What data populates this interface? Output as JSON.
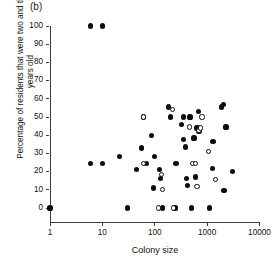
{
  "panel": {
    "label": "(b)"
  },
  "axes": {
    "y_title": "Percentage of residents that were two and three years old",
    "x_title": "Colony size",
    "y_ticks": [
      0,
      10,
      20,
      30,
      40,
      50,
      60,
      70,
      80,
      90,
      100
    ],
    "x_ticks": [
      1,
      10,
      100,
      1000,
      10000
    ]
  },
  "legend": {
    "filled_label": "filled circle",
    "open_label": "open circle"
  },
  "chart_data": {
    "type": "scatter",
    "title": "(b)",
    "xlabel": "Colony size",
    "ylabel": "Percentage of residents that were two and three years old",
    "xscale": "log",
    "yscale": "linear",
    "xlim": [
      1,
      10000
    ],
    "ylim": [
      0,
      100
    ],
    "xticks": [
      1,
      10,
      100,
      1000,
      10000
    ],
    "yticks": [
      0,
      10,
      20,
      30,
      40,
      50,
      60,
      70,
      80,
      90,
      100
    ],
    "grid": false,
    "legend_position": "none",
    "series": [
      {
        "name": "filled circle",
        "marker": "filled-circle",
        "color": "#0d0d0d",
        "points": [
          [
            1,
            0
          ],
          [
            6,
            100
          ],
          [
            10,
            100
          ],
          [
            6,
            24.5
          ],
          [
            10,
            24.5
          ],
          [
            21,
            28.5
          ],
          [
            30,
            0
          ],
          [
            45,
            21
          ],
          [
            55,
            33
          ],
          [
            62,
            50
          ],
          [
            70,
            24.5
          ],
          [
            88,
            40
          ],
          [
            95,
            11
          ],
          [
            100,
            28.5
          ],
          [
            125,
            21
          ],
          [
            130,
            16
          ],
          [
            140,
            0
          ],
          [
            185,
            55.5
          ],
          [
            200,
            50
          ],
          [
            235,
            0
          ],
          [
            250,
            0
          ],
          [
            255,
            24.5
          ],
          [
            330,
            46
          ],
          [
            350,
            37.5
          ],
          [
            360,
            50
          ],
          [
            390,
            33.5
          ],
          [
            400,
            16
          ],
          [
            420,
            12.5
          ],
          [
            470,
            50
          ],
          [
            500,
            0
          ],
          [
            560,
            38.5
          ],
          [
            600,
            17
          ],
          [
            640,
            44
          ],
          [
            680,
            53
          ],
          [
            700,
            42
          ],
          [
            1100,
            0
          ],
          [
            1250,
            21.5
          ],
          [
            1300,
            36.5
          ],
          [
            1900,
            55.5
          ],
          [
            2050,
            57
          ],
          [
            2100,
            9.8
          ],
          [
            2300,
            44.5
          ],
          [
            3000,
            20
          ]
        ]
      },
      {
        "name": "open circle",
        "marker": "open-circle",
        "color": "#0d0d0d",
        "points": [
          [
            62,
            50
          ],
          [
            60,
            24.5
          ],
          [
            120,
            0
          ],
          [
            135,
            18.5
          ],
          [
            140,
            10
          ],
          [
            230,
            0
          ],
          [
            215,
            54
          ],
          [
            460,
            44.5
          ],
          [
            520,
            24.5
          ],
          [
            600,
            24.5
          ],
          [
            640,
            12
          ],
          [
            700,
            42.5
          ],
          [
            760,
            44
          ],
          [
            800,
            50
          ],
          [
            1050,
            31
          ],
          [
            1450,
            15.5
          ]
        ]
      }
    ]
  }
}
